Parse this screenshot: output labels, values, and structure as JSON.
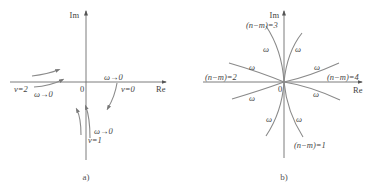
{
  "panel_a": {
    "caption": "a)",
    "axes": {
      "x_label": "Re",
      "y_label": "Im",
      "origin_label": "0"
    },
    "labels": {
      "nu2": "ν=2",
      "nu2_omega": "ω→0",
      "nu0": "ν=0",
      "nu0_omega": "ω→0",
      "nu1": "ν=1",
      "nu1_omega": "ω→0"
    }
  },
  "panel_b": {
    "caption": "b)",
    "axes": {
      "x_label": "Re",
      "y_label": "Im",
      "origin_label": "0"
    },
    "labels": {
      "nm3": "(n−m)=3",
      "nm2": "(n−m)=2",
      "nm4": "(n−m)=4",
      "nm1": "(n−m)=1",
      "omega": "ω"
    }
  },
  "colors": {
    "axis": "#6e6e6e",
    "curve": "#8a8a8a",
    "text": "#444444"
  }
}
